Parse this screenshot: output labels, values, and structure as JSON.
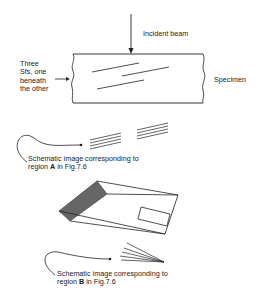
{
  "labels": {
    "incident_beam": "Incident beam",
    "stacking_faults": [
      "Three",
      "Sfs, one",
      "beneath",
      "the other"
    ],
    "specimen": "Specimen",
    "caption_a": {
      "line1": "Schematic  image corresponding to",
      "line2_pre": "region ",
      "line2_bold": "A",
      "line2_post": " in Fig.7.6"
    },
    "caption_b": {
      "line1": "Schematic  image corresponding to",
      "line2_pre": "region ",
      "line2_bold": "B",
      "line2_post": " in Fig.7.6"
    }
  },
  "colors": {
    "line": "#222222",
    "shaded_face": "#666666"
  }
}
